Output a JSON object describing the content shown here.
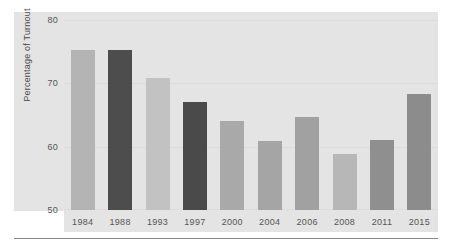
{
  "chart_data": {
    "type": "bar",
    "title": "",
    "subtitle": "",
    "xlabel": "",
    "ylabel": "Percentage of Turnout",
    "categories": [
      "1984",
      "1988",
      "1993",
      "1997",
      "2000",
      "2004",
      "2006",
      "2008",
      "2011",
      "2015"
    ],
    "values": [
      75.3,
      75.3,
      70.9,
      67.0,
      64.1,
      60.9,
      64.7,
      58.8,
      61.1,
      68.3
    ],
    "bar_colors": [
      "#b4b4b4",
      "#4d4d4d",
      "#c2c2c2",
      "#4a4a4a",
      "#a9a9a9",
      "#a5a5a5",
      "#a1a1a1",
      "#b7b7b7",
      "#8f8f8f",
      "#8c8c8c"
    ],
    "ylim": [
      50,
      80
    ],
    "yticks": [
      80,
      70,
      60,
      50
    ],
    "ytick_labels": [
      "80",
      "70",
      "60",
      "50"
    ],
    "grid": true,
    "legend": null,
    "legend_position": "none",
    "plot_background": "#e4e4e4",
    "axis_text_color": "#555555"
  }
}
